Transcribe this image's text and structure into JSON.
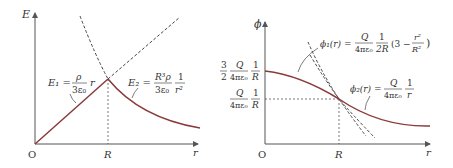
{
  "left": {
    "y_label": "E",
    "x_label": "r",
    "origin": "O",
    "tick": "R",
    "e1": {
      "lhs": "E₁ =",
      "num": "ρ",
      "den": "3ε₀",
      "tail": "r"
    },
    "e2": {
      "lhs": "E₂ =",
      "num": "R³ρ",
      "den": "3ε₀",
      "num2": "1",
      "den2": "r²"
    }
  },
  "right": {
    "y_label": "ϕ",
    "x_label": "r",
    "origin": "O",
    "tick": "R",
    "y1": {
      "c": "3",
      "cd": "2",
      "num": "Q",
      "den": "4πε₀",
      "n2": "1",
      "d2": "R"
    },
    "y2": {
      "num": "Q",
      "den": "4πε₀",
      "n2": "1",
      "d2": "R"
    },
    "phi1": {
      "lhs": "ϕ₁(r) =",
      "num": "Q",
      "den": "4πε₀",
      "n2": "1",
      "d2": "2R",
      "paren": "(3 −",
      "rn": "r²",
      "rd": "R²",
      "close": ")"
    },
    "phi2": {
      "lhs": "ϕ₂(r) =",
      "num": "Q",
      "den": "4πε₀",
      "n2": "1",
      "d2": "r"
    }
  },
  "colors": {
    "curve": "#8b3a3a",
    "axis": "#555555"
  }
}
